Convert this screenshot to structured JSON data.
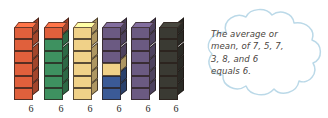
{
  "figure": {
    "kind": "math-manipulative-diagram"
  },
  "towers": {
    "count": 6,
    "cubes_per_tower": 6,
    "label_text": "6",
    "items": [
      {
        "index": 1,
        "name": "tower-1",
        "label": "6",
        "total_cubes": 6,
        "segments": [
          {
            "color": "#E0603C",
            "count": 6
          }
        ]
      },
      {
        "index": 2,
        "name": "tower-2",
        "label": "6",
        "total_cubes": 6,
        "segments": [
          {
            "color": "#E0603C",
            "count": 1
          },
          {
            "color": "#3E9160",
            "count": 5
          }
        ]
      },
      {
        "index": 3,
        "name": "tower-3",
        "label": "6",
        "total_cubes": 6,
        "segments": [
          {
            "color": "#F0D188",
            "count": 6
          }
        ]
      },
      {
        "index": 4,
        "name": "tower-4",
        "label": "6",
        "total_cubes": 6,
        "segments": [
          {
            "color": "#6B5A82",
            "count": 3
          },
          {
            "color": "#F0D188",
            "count": 1
          },
          {
            "color": "#3B5A96",
            "count": 2
          }
        ]
      },
      {
        "index": 5,
        "name": "tower-5",
        "label": "6",
        "total_cubes": 6,
        "segments": [
          {
            "color": "#6B5A82",
            "count": 6
          }
        ]
      },
      {
        "index": 6,
        "name": "tower-6",
        "label": "6",
        "total_cubes": 6,
        "segments": [
          {
            "color": "#3A3A33",
            "count": 6
          }
        ]
      }
    ]
  },
  "cloud": {
    "name": "thought-cloud",
    "outline_color": "#BBD9E8",
    "fill_color": "#FFFFFF",
    "lines": [
      "The average or",
      "mean, of 7, 5, 7,",
      "3, 8, and 6",
      "equals 6."
    ],
    "full_text": "The average or mean, of 7, 5, 7, 3, 8, and 6 equals 6.",
    "values_referenced": [
      7,
      5,
      7,
      3,
      8,
      6
    ],
    "mean_value": 6
  },
  "colors": {
    "orange": "#E0603C",
    "green": "#3E9160",
    "yellow": "#F0D188",
    "purple": "#6B5A82",
    "blue": "#3B5A96",
    "dark": "#3A3A33",
    "cloud_stroke": "#BBD9E8",
    "text": "#4A4540",
    "label_text": "#231F1C",
    "background": "#FFFFFF"
  }
}
